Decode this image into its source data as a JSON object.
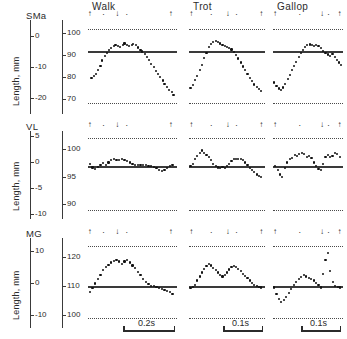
{
  "figure": {
    "axis_caption": "Length, mm"
  },
  "columns": [
    {
      "key": "walk",
      "label": "Walk",
      "scale_label": "0.2s"
    },
    {
      "key": "trot",
      "label": "Trot",
      "scale_label": "0.1s"
    },
    {
      "key": "gallop",
      "label": "Gallop",
      "scale_label": "0.1s"
    }
  ],
  "rows": [
    {
      "key": "sma",
      "label": "SMa",
      "left_ticks": [
        "0",
        "-10",
        "-20"
      ],
      "right_ticks": [
        "100",
        "90",
        "80",
        "70"
      ]
    },
    {
      "key": "vl",
      "label": "VL",
      "left_ticks": [
        "5",
        "0",
        "-5",
        "-10"
      ],
      "right_ticks": [
        "100",
        "95",
        "90"
      ]
    },
    {
      "key": "mg",
      "label": "MG",
      "left_ticks": [
        "10",
        "0",
        "-10"
      ],
      "right_ticks": [
        "120",
        "110",
        "100"
      ]
    }
  ],
  "events": {
    "walk": [
      {
        "t": 0.02,
        "g": "up"
      },
      {
        "t": 0.18,
        "g": "dot"
      },
      {
        "t": 0.33,
        "g": "down"
      },
      {
        "t": 0.44,
        "g": "dot"
      },
      {
        "t": 0.93,
        "g": "up"
      }
    ],
    "trot": [
      {
        "t": 0.03,
        "g": "up"
      },
      {
        "t": 0.3,
        "g": "dot"
      },
      {
        "t": 0.51,
        "g": "down"
      },
      {
        "t": 0.63,
        "g": "dot"
      },
      {
        "t": 0.95,
        "g": "up"
      }
    ],
    "gallop": [
      {
        "t": 0.03,
        "g": "up"
      },
      {
        "t": 0.39,
        "g": "dot"
      },
      {
        "t": 0.7,
        "g": "down"
      },
      {
        "t": 0.8,
        "g": "dot"
      },
      {
        "t": 0.95,
        "g": "up"
      }
    ]
  },
  "chart_data": {
    "type": "scatter",
    "title": "",
    "xlabel": "",
    "ylabel": "Length, mm",
    "grid": false,
    "legend": "none",
    "panel_grid": {
      "rows": 3,
      "cols": 3
    },
    "row_variables": [
      "SMa",
      "VL",
      "MG"
    ],
    "col_conditions": [
      "Walk",
      "Trot",
      "Gallop"
    ],
    "time_scale_bars": {
      "Walk": "0.2s",
      "Trot": "0.1s",
      "Gallop": "0.1s"
    },
    "axes": {
      "sma": {
        "left_range": [
          -25,
          5
        ],
        "left_ticks": [
          0,
          -10,
          -20
        ],
        "right_range": [
          65,
          105
        ],
        "right_ticks": [
          100,
          90,
          80,
          70
        ],
        "dotted_upper": 102,
        "dotted_lower": 68,
        "baseline": 92
      },
      "vl": {
        "left_range": [
          -11,
          6
        ],
        "left_ticks": [
          5,
          0,
          -5,
          -10
        ],
        "right_range": [
          88,
          103
        ],
        "right_ticks": [
          100,
          95,
          90
        ],
        "dotted_upper": 102,
        "dotted_lower": 89,
        "baseline": 97
      },
      "mg": {
        "left_range": [
          -14,
          14
        ],
        "left_ticks": [
          10,
          0,
          -10
        ],
        "right_range": [
          97,
          126
        ],
        "right_ticks": [
          120,
          110,
          100
        ],
        "dotted_upper": 124,
        "dotted_lower": 99,
        "baseline": 110
      }
    },
    "panels": [
      {
        "row": "SMa",
        "col": "Walk",
        "unit": "mm",
        "x": [
          0.04,
          0.07,
          0.09,
          0.11,
          0.14,
          0.16,
          0.19,
          0.21,
          0.24,
          0.26,
          0.29,
          0.31,
          0.34,
          0.36,
          0.39,
          0.41,
          0.44,
          0.46,
          0.49,
          0.51,
          0.54,
          0.56,
          0.59,
          0.61,
          0.64,
          0.66,
          0.69,
          0.71,
          0.74,
          0.76,
          0.79,
          0.81,
          0.84,
          0.86,
          0.89,
          0.91,
          0.94,
          0.96
        ],
        "y": [
          79.5,
          80.5,
          81.5,
          83.0,
          85.0,
          87.5,
          89.5,
          91.0,
          92.3,
          93.2,
          94.0,
          94.6,
          94.2,
          93.8,
          94.6,
          95.2,
          94.6,
          94.0,
          94.6,
          95.0,
          94.4,
          93.4,
          92.4,
          91.6,
          90.6,
          89.2,
          87.6,
          86.0,
          84.4,
          82.8,
          81.4,
          80.0,
          78.4,
          77.0,
          75.4,
          74.0,
          73.0,
          72.0
        ]
      },
      {
        "row": "SMa",
        "col": "Trot",
        "unit": "mm",
        "x": [
          0.02,
          0.05,
          0.08,
          0.11,
          0.14,
          0.17,
          0.2,
          0.23,
          0.26,
          0.29,
          0.32,
          0.35,
          0.38,
          0.41,
          0.44,
          0.47,
          0.5,
          0.53,
          0.56,
          0.59,
          0.62,
          0.65,
          0.68,
          0.71,
          0.74,
          0.77,
          0.8,
          0.83,
          0.86,
          0.89,
          0.92,
          0.95
        ],
        "y": [
          75.0,
          76.5,
          78.5,
          80.5,
          83.0,
          85.5,
          88.5,
          91.0,
          93.5,
          95.0,
          96.0,
          96.3,
          95.8,
          95.2,
          94.6,
          94.2,
          93.8,
          93.2,
          92.5,
          91.4,
          90.0,
          88.4,
          86.6,
          84.8,
          83.0,
          81.2,
          79.4,
          78.0,
          76.6,
          75.4,
          74.4,
          73.6
        ]
      },
      {
        "row": "SMa",
        "col": "Gallop",
        "unit": "mm",
        "x": [
          0.02,
          0.05,
          0.08,
          0.11,
          0.14,
          0.17,
          0.21,
          0.24,
          0.27,
          0.3,
          0.33,
          0.37,
          0.4,
          0.43,
          0.46,
          0.49,
          0.53,
          0.56,
          0.59,
          0.62,
          0.65,
          0.69,
          0.72,
          0.75,
          0.78,
          0.81,
          0.85,
          0.88,
          0.91,
          0.94,
          0.97
        ],
        "y": [
          77.5,
          76.0,
          74.8,
          74.0,
          75.2,
          77.0,
          79.0,
          81.0,
          83.0,
          85.0,
          87.0,
          89.0,
          90.8,
          92.4,
          93.6,
          94.4,
          94.8,
          94.6,
          94.0,
          94.4,
          94.0,
          93.0,
          92.0,
          91.0,
          90.2,
          89.4,
          90.4,
          89.0,
          87.8,
          86.6,
          85.6
        ]
      },
      {
        "row": "VL",
        "col": "Walk",
        "unit": "mm",
        "x": [
          0.02,
          0.05,
          0.08,
          0.11,
          0.14,
          0.17,
          0.2,
          0.23,
          0.26,
          0.29,
          0.32,
          0.35,
          0.38,
          0.41,
          0.44,
          0.47,
          0.5,
          0.53,
          0.56,
          0.59,
          0.62,
          0.65,
          0.68,
          0.71,
          0.74,
          0.77,
          0.8,
          0.83,
          0.86,
          0.89,
          0.92,
          0.95
        ],
        "y": [
          97.3,
          96.7,
          96.4,
          96.8,
          97.2,
          97.5,
          97.2,
          97.6,
          98.0,
          98.2,
          98.1,
          98.0,
          98.2,
          98.1,
          97.9,
          97.6,
          97.4,
          97.2,
          97.1,
          97.1,
          97.1,
          97.1,
          97.0,
          97.0,
          96.8,
          96.6,
          96.3,
          96.1,
          96.3,
          96.6,
          96.9,
          97.2
        ]
      },
      {
        "row": "VL",
        "col": "Trot",
        "unit": "mm",
        "x": [
          0.02,
          0.05,
          0.08,
          0.11,
          0.14,
          0.17,
          0.2,
          0.23,
          0.26,
          0.29,
          0.32,
          0.35,
          0.38,
          0.41,
          0.44,
          0.47,
          0.5,
          0.53,
          0.56,
          0.59,
          0.62,
          0.65,
          0.68,
          0.71,
          0.74,
          0.77,
          0.8,
          0.83,
          0.86,
          0.89,
          0.92,
          0.95
        ],
        "y": [
          97.0,
          97.4,
          98.2,
          98.8,
          99.4,
          99.8,
          99.4,
          99.0,
          98.6,
          98.0,
          97.4,
          97.0,
          96.7,
          96.6,
          96.8,
          96.6,
          97.0,
          97.4,
          97.9,
          98.2,
          98.2,
          98.2,
          98.2,
          98.0,
          97.6,
          97.1,
          96.6,
          96.2,
          95.8,
          95.4,
          95.1,
          94.9
        ]
      },
      {
        "row": "VL",
        "col": "Gallop",
        "unit": "mm",
        "x": [
          0.03,
          0.07,
          0.1,
          0.13,
          0.17,
          0.2,
          0.24,
          0.27,
          0.31,
          0.34,
          0.37,
          0.41,
          0.44,
          0.48,
          0.51,
          0.55,
          0.58,
          0.61,
          0.65,
          0.68,
          0.72,
          0.75,
          0.79,
          0.82,
          0.85,
          0.89,
          0.92,
          0.96
        ],
        "y": [
          96.9,
          96.2,
          95.4,
          95.0,
          96.6,
          97.6,
          98.2,
          98.4,
          99.0,
          98.8,
          99.2,
          99.4,
          99.1,
          98.6,
          98.8,
          98.4,
          97.6,
          97.0,
          96.4,
          96.2,
          97.4,
          98.6,
          99.0,
          98.6,
          98.8,
          99.4,
          99.1,
          98.6
        ]
      },
      {
        "row": "MG",
        "col": "Walk",
        "unit": "mm",
        "x": [
          0.02,
          0.05,
          0.08,
          0.11,
          0.14,
          0.17,
          0.2,
          0.23,
          0.26,
          0.29,
          0.32,
          0.35,
          0.38,
          0.41,
          0.44,
          0.47,
          0.5,
          0.53,
          0.56,
          0.59,
          0.62,
          0.65,
          0.68,
          0.71,
          0.74,
          0.77,
          0.8,
          0.83,
          0.86,
          0.89,
          0.92,
          0.95
        ],
        "y": [
          108.0,
          109.5,
          111.0,
          112.5,
          114.0,
          115.6,
          116.6,
          117.4,
          118.2,
          118.8,
          119.2,
          118.6,
          117.8,
          118.6,
          119.0,
          118.2,
          117.2,
          116.2,
          115.0,
          113.8,
          112.6,
          111.6,
          110.8,
          110.2,
          110.0,
          109.8,
          109.4,
          109.0,
          108.8,
          108.4,
          108.0,
          107.4
        ]
      },
      {
        "row": "MG",
        "col": "Trot",
        "unit": "mm",
        "x": [
          0.02,
          0.05,
          0.08,
          0.11,
          0.14,
          0.17,
          0.2,
          0.23,
          0.26,
          0.29,
          0.32,
          0.35,
          0.38,
          0.41,
          0.44,
          0.47,
          0.5,
          0.53,
          0.56,
          0.59,
          0.62,
          0.65,
          0.68,
          0.71,
          0.74,
          0.77,
          0.8,
          0.83,
          0.86,
          0.89,
          0.92,
          0.95
        ],
        "y": [
          109.4,
          109.8,
          110.6,
          112.0,
          113.4,
          114.8,
          116.0,
          117.0,
          117.6,
          117.2,
          116.4,
          115.6,
          114.8,
          114.0,
          113.4,
          113.8,
          114.8,
          115.8,
          116.6,
          117.0,
          116.6,
          116.0,
          115.2,
          114.4,
          113.6,
          112.8,
          112.0,
          111.2,
          110.6,
          110.2,
          109.8,
          109.6
        ]
      },
      {
        "row": "MG",
        "col": "Gallop",
        "unit": "mm",
        "x": [
          0.02,
          0.05,
          0.09,
          0.12,
          0.16,
          0.19,
          0.23,
          0.26,
          0.3,
          0.33,
          0.37,
          0.4,
          0.44,
          0.47,
          0.51,
          0.54,
          0.58,
          0.61,
          0.65,
          0.68,
          0.72,
          0.75,
          0.79,
          0.82,
          0.86,
          0.89,
          0.93,
          0.96
        ],
        "y": [
          109.6,
          107.4,
          105.6,
          104.6,
          105.2,
          106.4,
          107.8,
          109.2,
          110.4,
          111.4,
          112.4,
          113.2,
          113.8,
          113.4,
          113.0,
          112.6,
          112.0,
          111.2,
          110.4,
          109.6,
          114.2,
          119.2,
          121.6,
          115.4,
          111.6,
          110.0,
          109.8,
          109.6
        ]
      }
    ]
  }
}
